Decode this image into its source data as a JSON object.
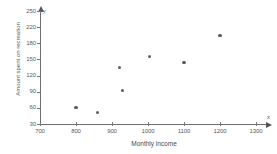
{
  "chart_data": {
    "type": "scatter",
    "title": "",
    "xlabel": "Monthly income",
    "ylabel": "Amount spent on recreation",
    "xlim": [
      700,
      1315
    ],
    "ylim": [
      30,
      258
    ],
    "grid": false,
    "legend": null,
    "x_ticks": [
      700,
      800,
      900,
      1000,
      1100,
      1200,
      1300
    ],
    "y_ticks": [
      30,
      60,
      90,
      120,
      150,
      180,
      220,
      250
    ],
    "x_tick_labels": [
      "700",
      "800",
      "900",
      "1000",
      "1100",
      "1200",
      "1300"
    ],
    "y_tick_labels": [
      "30",
      "60",
      "90",
      "120",
      "150",
      "180",
      "220",
      "250"
    ],
    "axis_symbols": {
      "x": "x",
      "y": "y"
    },
    "points": [
      {
        "x": 800,
        "y": 60
      },
      {
        "x": 860,
        "y": 51
      },
      {
        "x": 920,
        "y": 135
      },
      {
        "x": 930,
        "y": 92
      },
      {
        "x": 1005,
        "y": 156
      },
      {
        "x": 1100,
        "y": 145
      },
      {
        "x": 1200,
        "y": 200
      }
    ],
    "series": [
      {
        "name": "Recreation spending vs income",
        "x": [
          800,
          860,
          920,
          930,
          1005,
          1100,
          1200
        ],
        "values": [
          60,
          51,
          135,
          92,
          156,
          145,
          200
        ]
      }
    ]
  },
  "colors": {
    "marker": "#5d5d5d",
    "axis": "#6e6e6e",
    "tick_text": "#5a5a5a",
    "title_text": "#4a4a4a",
    "background": "#ffffff"
  }
}
